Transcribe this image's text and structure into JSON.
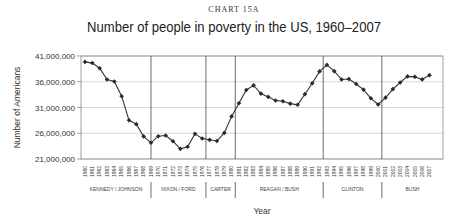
{
  "header": {
    "kicker": "CHART 15A",
    "title": "Number of people in poverty in the US, 1960–2007"
  },
  "colors": {
    "line": "#333333",
    "marker": "#2a2a2a",
    "grid": "#cfcfcf",
    "frame": "#888888",
    "divider": "#444444"
  },
  "chart_data": {
    "type": "line",
    "title": "Number of people in poverty in the US, 1960–2007",
    "subtitle": "CHART 15A",
    "xlabel": "Year",
    "ylabel": "Number of Americans",
    "ylim": [
      21000000,
      41000000
    ],
    "yticks": [
      "41,000,000",
      "36,000,000",
      "31,000,000",
      "26,000,000",
      "21,000,000"
    ],
    "ytick_values": [
      41000000,
      36000000,
      31000000,
      26000000,
      21000000
    ],
    "grid": true,
    "legend": null,
    "x": [
      1960,
      1961,
      1962,
      1963,
      1964,
      1965,
      1966,
      1967,
      1968,
      1969,
      1970,
      1971,
      1972,
      1973,
      1974,
      1975,
      1976,
      1977,
      1978,
      1979,
      1980,
      1981,
      1982,
      1983,
      1984,
      1985,
      1986,
      1987,
      1988,
      1989,
      1990,
      1991,
      1992,
      1993,
      1994,
      1995,
      1996,
      1997,
      1998,
      1999,
      2000,
      2001,
      2002,
      2003,
      2004,
      2005,
      2006,
      2007
    ],
    "series": [
      {
        "name": "Number of people in poverty",
        "values": [
          39850000,
          39630000,
          38630000,
          36440000,
          36060000,
          33190000,
          28510000,
          27770000,
          25390000,
          24150000,
          25420000,
          25560000,
          24460000,
          22970000,
          23370000,
          25880000,
          24980000,
          24720000,
          24500000,
          26070000,
          29270000,
          31820000,
          34400000,
          35300000,
          33700000,
          33060000,
          32370000,
          32220000,
          31750000,
          31530000,
          33590000,
          35710000,
          38010000,
          39270000,
          38060000,
          36430000,
          36530000,
          35570000,
          34480000,
          32790000,
          31580000,
          32910000,
          34570000,
          35860000,
          37040000,
          36950000,
          36460000,
          37280000
        ]
      }
    ],
    "annotations": {
      "eras": [
        {
          "label": "KENNEDY / JOHNSON",
          "start": 1960,
          "end": 1969
        },
        {
          "label": "NIXON / FORD",
          "start": 1969,
          "end": 1977
        },
        {
          "label": "CARTER",
          "start": 1977,
          "end": 1981
        },
        {
          "label": "REAGAN / BUSH",
          "start": 1981,
          "end": 1993
        },
        {
          "label": "CLINTON",
          "start": 1993,
          "end": 2001
        },
        {
          "label": "BUSH",
          "start": 2001,
          "end": 2007
        }
      ]
    }
  }
}
